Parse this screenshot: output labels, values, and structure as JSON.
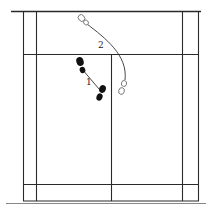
{
  "diagram": {
    "type": "badminton-court-footwork",
    "labels": {
      "step1": "1",
      "step2": "2"
    },
    "colors": {
      "lines": "#2a2a2a",
      "filled_foot": "#111111",
      "outline_foot": "#666666",
      "background": "#ffffff"
    }
  }
}
